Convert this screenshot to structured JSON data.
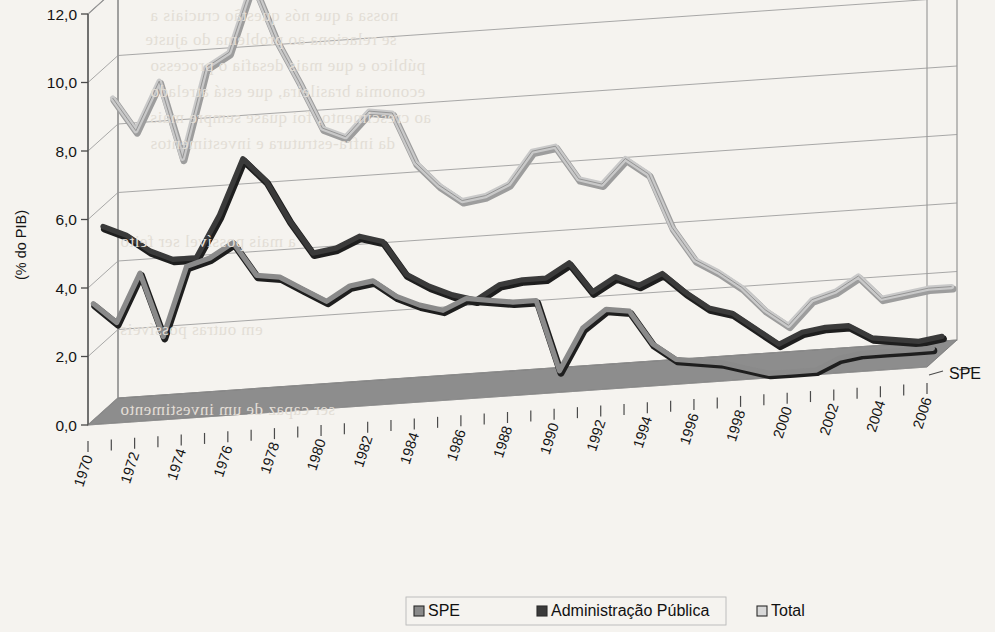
{
  "figure": {
    "axis_title_y": "(% do PIB)",
    "z_axis_label": "SPE",
    "y_ticks": [
      "0,0",
      "2,0",
      "4,0",
      "6,0",
      "8,0",
      "10,0",
      "12,0"
    ],
    "x_ticks": [
      "1970",
      "1972",
      "1974",
      "1976",
      "1978",
      "1980",
      "1982",
      "1984",
      "1986",
      "1988",
      "1990",
      "1992",
      "1994",
      "1996",
      "1998",
      "2000",
      "2002",
      "2004",
      "2006"
    ]
  },
  "legend": {
    "items": [
      {
        "label": "SPE",
        "color": "#8a8a8a"
      },
      {
        "label": "Administração Pública",
        "color": "#3a3a3a"
      },
      {
        "label": "Total",
        "color": "#d8d8d8"
      }
    ]
  },
  "colors": {
    "floor": "#8d8d8d",
    "frame": "#8b8b8b",
    "grid": "#9a9a9a",
    "axis": "#4a4a4a",
    "background": "#f5f3ef",
    "spe": "#8a8a8a",
    "admin": "#3a3a3a",
    "total": "#c9c9c9"
  },
  "bleed_text": [
    {
      "x": 150,
      "y": 6,
      "text": "nossa a que nós questão cruciais a"
    },
    {
      "x": 145,
      "y": 30,
      "text": "se relaciona ao problema do ajuste"
    },
    {
      "x": 150,
      "y": 56,
      "text": "público e que mais desafia o processo"
    },
    {
      "x": 150,
      "y": 82,
      "text": "economia brasileira, que está atrelado"
    },
    {
      "x": 150,
      "y": 108,
      "text": "ao crescimento, foi quase sempre mais"
    },
    {
      "x": 150,
      "y": 134,
      "text": "da infra-estrutura e investimentos"
    },
    {
      "x": 120,
      "y": 232,
      "text": "a mais possível ser feito"
    },
    {
      "x": 120,
      "y": 320,
      "text": "em outras possíveis "
    },
    {
      "x": 120,
      "y": 400,
      "text": "ser capaz de um investimento"
    }
  ],
  "chart_data": {
    "type": "line",
    "title": "",
    "xlabel": "",
    "ylabel": "(% do PIB)",
    "ylim": [
      0,
      12
    ],
    "grid": true,
    "legend_position": "bottom",
    "x": [
      1970,
      1971,
      1972,
      1973,
      1974,
      1975,
      1976,
      1977,
      1978,
      1979,
      1980,
      1981,
      1982,
      1983,
      1984,
      1985,
      1986,
      1987,
      1988,
      1989,
      1990,
      1991,
      1992,
      1993,
      1994,
      1995,
      1996,
      1997,
      1998,
      1999,
      2000,
      2001,
      2002,
      2003,
      2004,
      2005,
      2006
    ],
    "series": [
      {
        "name": "Total",
        "color": "#c9c9c9",
        "values": [
          8.9,
          7.9,
          9.3,
          7.0,
          9.6,
          10.0,
          12.0,
          10.3,
          9.0,
          7.6,
          7.3,
          8.0,
          7.9,
          6.4,
          5.7,
          5.2,
          5.3,
          5.6,
          6.5,
          6.6,
          5.6,
          5.4,
          6.1,
          5.6,
          4.0,
          3.0,
          2.6,
          2.1,
          1.4,
          0.9,
          1.6,
          1.8,
          2.2,
          1.5,
          1.6,
          1.7,
          1.7
        ]
      },
      {
        "name": "Administração Pública",
        "color": "#3a3a3a",
        "values": [
          5.4,
          5.1,
          4.6,
          4.3,
          4.3,
          5.5,
          7.1,
          6.4,
          5.2,
          4.2,
          4.3,
          4.6,
          4.4,
          3.4,
          3.0,
          2.7,
          2.5,
          2.9,
          3.0,
          3.0,
          3.4,
          2.5,
          2.9,
          2.6,
          2.9,
          2.3,
          1.8,
          1.6,
          1.1,
          0.6,
          0.9,
          1.0,
          1.0,
          0.6,
          0.5,
          0.4,
          0.5
        ]
      },
      {
        "name": "SPE",
        "color": "#8a8a8a",
        "values": [
          3.4,
          2.8,
          4.2,
          2.3,
          4.3,
          4.5,
          4.9,
          3.9,
          3.8,
          3.4,
          3.0,
          3.4,
          3.5,
          3.0,
          2.7,
          2.5,
          2.8,
          2.7,
          2.6,
          2.6,
          0.5,
          1.7,
          2.2,
          2.1,
          1.1,
          0.6,
          0.5,
          0.4,
          0.2,
          0.0,
          0.0,
          0.0,
          0.3,
          0.4,
          0.4,
          0.4,
          0.4
        ]
      }
    ]
  }
}
